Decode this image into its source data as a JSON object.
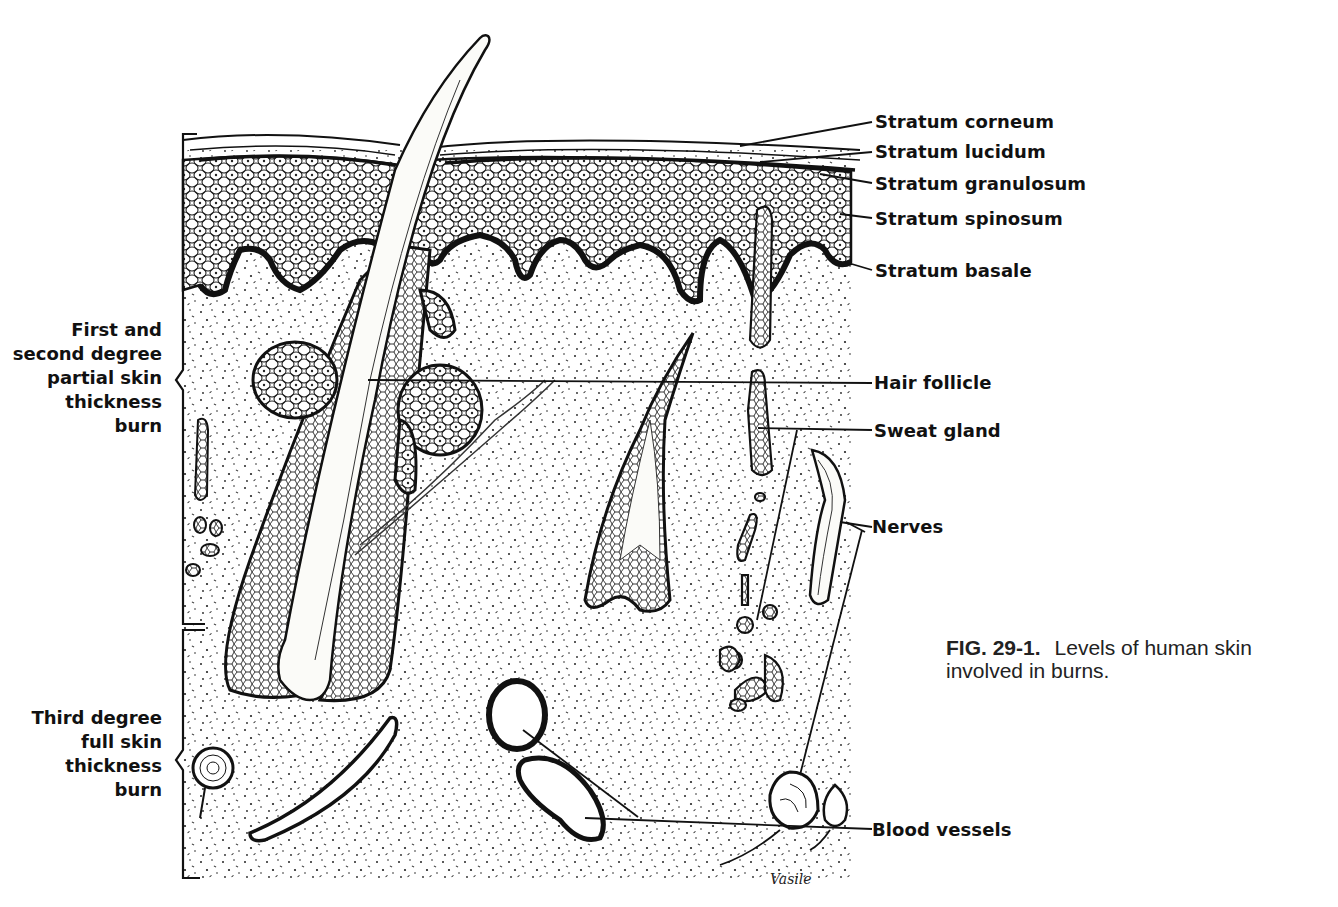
{
  "figure": {
    "number": "FIG. 29-1.",
    "caption_line1": "Levels of human skin",
    "caption_line2": "involved in burns.",
    "signature": "Vasile"
  },
  "right_labels": {
    "stratum_corneum": "Stratum corneum",
    "stratum_lucidum": "Stratum lucidum",
    "stratum_granulosum": "Stratum granulosum",
    "stratum_spinosum": "Stratum spinosum",
    "stratum_basale": "Stratum basale",
    "hair_follicle": "Hair follicle",
    "sweat_gland": "Sweat gland",
    "nerves": "Nerves",
    "blood_vessels": "Blood vessels"
  },
  "left_labels": {
    "partial_burn": {
      "lines": [
        "First and",
        "second degree",
        "partial skin",
        "thickness",
        "burn"
      ]
    },
    "full_burn": {
      "lines": [
        "Third degree",
        "full skin",
        "thickness",
        "burn"
      ]
    }
  },
  "colors": {
    "ink": "#111111",
    "paper": "#ffffff"
  }
}
